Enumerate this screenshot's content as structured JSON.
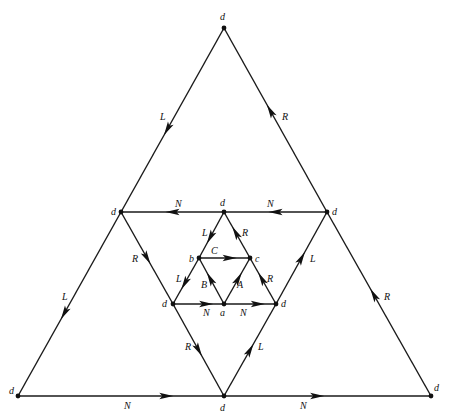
{
  "diagram": {
    "type": "directed-graph",
    "colors": {
      "line": "#1a1a1a",
      "node": "#111111",
      "background": "#ffffff"
    },
    "nodes": [
      {
        "id": "d_top",
        "label": "d",
        "x": 224,
        "y": 28,
        "lx": 220,
        "ly": 20
      },
      {
        "id": "d_outer_bl",
        "label": "d",
        "x": 18,
        "y": 396,
        "lx": 9,
        "ly": 394
      },
      {
        "id": "d_outer_bm",
        "label": "d",
        "x": 224,
        "y": 396,
        "lx": 220,
        "ly": 411
      },
      {
        "id": "d_outer_br",
        "label": "d",
        "x": 431,
        "y": 396,
        "lx": 434,
        "ly": 391
      },
      {
        "id": "d_mid_ul",
        "label": "d",
        "x": 121,
        "y": 212,
        "lx": 111,
        "ly": 215
      },
      {
        "id": "d_mid_ur",
        "label": "d",
        "x": 327,
        "y": 212,
        "lx": 332,
        "ly": 215
      },
      {
        "id": "d_inner_top",
        "label": "d",
        "x": 224,
        "y": 212,
        "lx": 220,
        "ly": 206
      },
      {
        "id": "b",
        "label": "b",
        "x": 199,
        "y": 258,
        "lx": 189,
        "ly": 262
      },
      {
        "id": "c",
        "label": "c",
        "x": 250,
        "y": 258,
        "lx": 255,
        "ly": 262
      },
      {
        "id": "d_inner_bl",
        "label": "d",
        "x": 173,
        "y": 304,
        "lx": 162,
        "ly": 307
      },
      {
        "id": "a",
        "label": "a",
        "x": 224,
        "y": 304,
        "lx": 220,
        "ly": 316
      },
      {
        "id": "d_inner_br",
        "label": "d",
        "x": 276,
        "y": 304,
        "lx": 281,
        "ly": 307
      }
    ],
    "edges": [
      {
        "from": "d_top",
        "to": "d_mid_ul",
        "label": "L",
        "t": 0.55,
        "lx": 160,
        "ly": 120
      },
      {
        "from": "d_mid_ur",
        "to": "d_top",
        "label": "R",
        "t": 0.55,
        "lx": 282,
        "ly": 120
      },
      {
        "from": "d_mid_ul",
        "to": "d_outer_bl",
        "label": "L",
        "t": 0.55,
        "lx": 62,
        "ly": 300
      },
      {
        "from": "d_outer_br",
        "to": "d_mid_ur",
        "label": "R",
        "t": 0.55,
        "lx": 384,
        "ly": 300
      },
      {
        "from": "d_outer_bl",
        "to": "d_outer_bm",
        "label": "N",
        "t": 0.72,
        "lx": 124,
        "ly": 409
      },
      {
        "from": "d_outer_bm",
        "to": "d_outer_br",
        "label": "N",
        "t": 0.45,
        "lx": 300,
        "ly": 409
      },
      {
        "from": "d_mid_ur",
        "to": "d_inner_top",
        "label": "N",
        "t": 0.5,
        "lx": 267,
        "ly": 207
      },
      {
        "from": "d_inner_top",
        "to": "d_mid_ul",
        "label": "N",
        "t": 0.5,
        "lx": 175,
        "ly": 207
      },
      {
        "from": "d_mid_ul",
        "to": "d_inner_bl",
        "label": "R",
        "t": 0.5,
        "lx": 132,
        "ly": 262
      },
      {
        "from": "d_inner_br",
        "to": "d_mid_ur",
        "label": "L",
        "t": 0.5,
        "lx": 310,
        "ly": 262
      },
      {
        "from": "d_inner_bl",
        "to": "d_outer_bm",
        "label": "R",
        "t": 0.5,
        "lx": 185,
        "ly": 350
      },
      {
        "from": "d_outer_bm",
        "to": "d_inner_br",
        "label": "L",
        "t": 0.5,
        "lx": 258,
        "ly": 350
      },
      {
        "from": "d_inner_top",
        "to": "b",
        "label": "L",
        "t": 0.55,
        "lx": 202,
        "ly": 236
      },
      {
        "from": "c",
        "to": "d_inner_top",
        "label": "R",
        "t": 0.55,
        "lx": 242,
        "ly": 236
      },
      {
        "from": "b",
        "to": "c",
        "label": "C",
        "t": 0.6,
        "lx": 211,
        "ly": 254
      },
      {
        "from": "b",
        "to": "d_inner_bl",
        "label": "L",
        "t": 0.55,
        "lx": 176,
        "ly": 282
      },
      {
        "from": "a",
        "to": "b",
        "label": "B",
        "t": 0.55,
        "lx": 201,
        "ly": 288
      },
      {
        "from": "a",
        "to": "c",
        "label": "A",
        "t": 0.55,
        "lx": 237,
        "ly": 288
      },
      {
        "from": "d_inner_br",
        "to": "c",
        "label": "R",
        "t": 0.55,
        "lx": 267,
        "ly": 282
      },
      {
        "from": "d_inner_bl",
        "to": "a",
        "label": "N",
        "t": 0.65,
        "lx": 203,
        "ly": 316
      },
      {
        "from": "a",
        "to": "d_inner_br",
        "label": "N",
        "t": 0.65,
        "lx": 240,
        "ly": 316
      }
    ]
  }
}
